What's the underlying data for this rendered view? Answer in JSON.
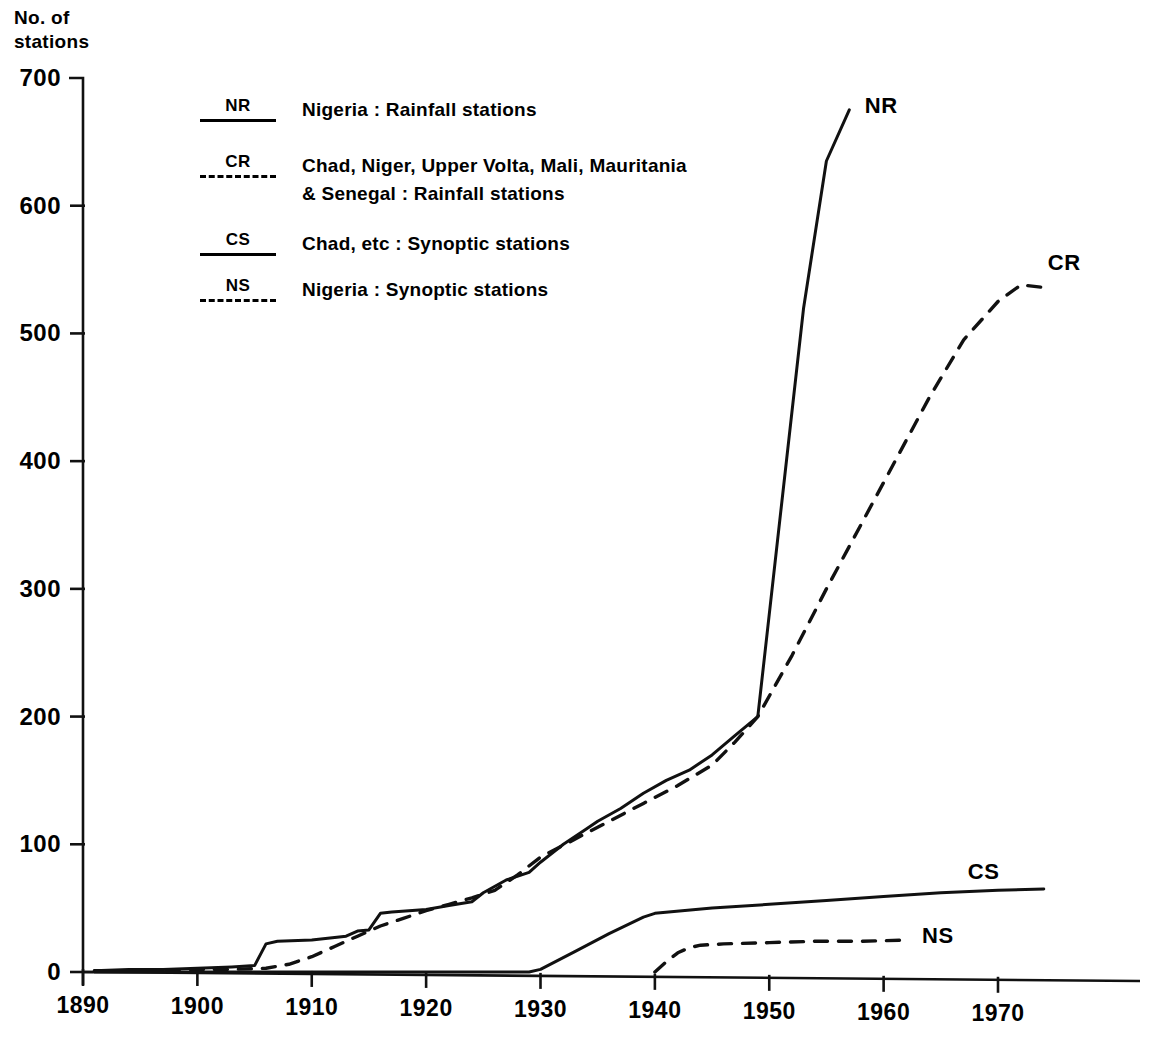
{
  "chart_data": {
    "type": "line",
    "title": "",
    "ylabel": "No. of\nstations",
    "xlabel": "",
    "xlim": [
      1890,
      1975
    ],
    "ylim": [
      0,
      700
    ],
    "grid": false,
    "legend_position": "upper-left-inside",
    "ytick_labels": [
      "0",
      "100",
      "200",
      "300",
      "400",
      "500",
      "600",
      "700"
    ],
    "ytick_values": [
      0,
      100,
      200,
      300,
      400,
      500,
      600,
      700
    ],
    "xtick_labels": [
      "1890",
      "1900",
      "1910",
      "1920",
      "1930",
      "1940",
      "1950",
      "1960",
      "1970"
    ],
    "xtick_values": [
      1890,
      1900,
      1910,
      1920,
      1930,
      1940,
      1950,
      1960,
      1970
    ],
    "series": [
      {
        "name": "NR",
        "label": "Nigeria : Rainfall stations",
        "style": "solid",
        "end_tag": "NR",
        "x": [
          1891,
          1894,
          1897,
          1900,
          1903,
          1905,
          1906,
          1907,
          1910,
          1913,
          1914,
          1915,
          1916,
          1917,
          1920,
          1922,
          1924,
          1925,
          1927,
          1929,
          1930,
          1932,
          1934,
          1935,
          1937,
          1939,
          1941,
          1943,
          1945,
          1947,
          1949,
          1951,
          1953,
          1955,
          1957
        ],
        "y": [
          1,
          2,
          2,
          3,
          4,
          5,
          22,
          24,
          25,
          28,
          32,
          33,
          46,
          47,
          49,
          52,
          55,
          62,
          72,
          78,
          86,
          100,
          112,
          118,
          128,
          140,
          150,
          158,
          170,
          185,
          200,
          360,
          520,
          635,
          675
        ]
      },
      {
        "name": "CR",
        "label": "Chad, Niger, Upper Volta, Mali, Mauritania\n& Senegal : Rainfall stations",
        "style": "dashed",
        "end_tag": "CR",
        "x": [
          1891,
          1895,
          1900,
          1903,
          1906,
          1908,
          1910,
          1912,
          1914,
          1916,
          1918,
          1920,
          1922,
          1924,
          1926,
          1928,
          1930,
          1933,
          1936,
          1939,
          1942,
          1945,
          1947,
          1949,
          1952,
          1955,
          1958,
          1961,
          1964,
          1967,
          1970,
          1972,
          1974
        ],
        "y": [
          1,
          1,
          2,
          2,
          3,
          6,
          12,
          20,
          28,
          36,
          42,
          48,
          53,
          58,
          64,
          76,
          90,
          104,
          118,
          132,
          146,
          162,
          180,
          200,
          248,
          300,
          350,
          400,
          450,
          495,
          525,
          538,
          536
        ]
      },
      {
        "name": "CS",
        "label": "Chad, etc : Synoptic stations",
        "style": "solid",
        "end_tag": "CS",
        "x": [
          1891,
          1900,
          1910,
          1920,
          1929,
          1930,
          1933,
          1936,
          1939,
          1940,
          1945,
          1950,
          1955,
          1960,
          1965,
          1970,
          1974
        ],
        "y": [
          0,
          0,
          0,
          0,
          0,
          2,
          16,
          30,
          43,
          46,
          50,
          53,
          56,
          59,
          62,
          64,
          65
        ]
      },
      {
        "name": "NS",
        "label": "Nigeria : Synoptic stations",
        "style": "dashed",
        "end_tag": "NS",
        "x": [
          1940,
          1941,
          1942,
          1943,
          1944,
          1946,
          1950,
          1954,
          1958,
          1962
        ],
        "y": [
          0,
          8,
          15,
          19,
          21,
          22,
          23,
          24,
          24,
          25
        ]
      }
    ],
    "annotations": [
      {
        "text": "NR",
        "x": 1958,
        "y": 678
      },
      {
        "text": "CR",
        "x": 1974,
        "y": 555
      },
      {
        "text": "CS",
        "x": 1967,
        "y": 78
      },
      {
        "text": "NS",
        "x": 1963,
        "y": 28
      }
    ]
  },
  "axis": {
    "y_title": "No. of\nstations"
  },
  "legend": {
    "items": [
      {
        "key": "NR",
        "style": "solid",
        "text": "Nigeria : Rainfall stations"
      },
      {
        "key": "CR",
        "style": "dashed",
        "text": "Chad, Niger, Upper Volta, Mali, Mauritania\n& Senegal : Rainfall stations"
      },
      {
        "key": "CS",
        "style": "solid",
        "text": "Chad, etc : Synoptic stations"
      },
      {
        "key": "NS",
        "style": "dashed",
        "text": "Nigeria : Synoptic stations"
      }
    ]
  }
}
